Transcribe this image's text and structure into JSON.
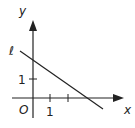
{
  "diagram": {
    "type": "coordinate-plane",
    "axes": {
      "x_label": "x",
      "y_label": "y",
      "origin_label": "O"
    },
    "ticks": {
      "x_tick_label": "1",
      "y_tick_label": "1"
    },
    "line": {
      "label": "ℓ",
      "y_intercept": 2,
      "x_intercept": 3,
      "slope": "-2/3"
    },
    "colors": {
      "stroke": "#222222",
      "background": "#ffffff"
    }
  }
}
